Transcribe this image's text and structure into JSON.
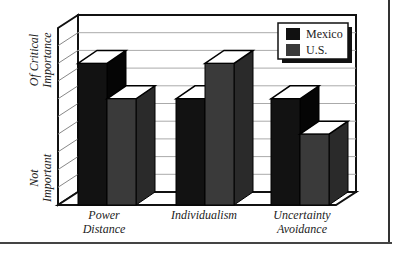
{
  "chart_data": {
    "type": "bar",
    "style": "3d-clustered",
    "title": "",
    "categories": [
      "Power Distance",
      "Individualism",
      "Uncertainty Avoidance"
    ],
    "category_lines": [
      [
        "Power",
        "Distance"
      ],
      [
        "Individualism"
      ],
      [
        "Uncertainty",
        "Avoidance"
      ]
    ],
    "series": [
      {
        "name": "Mexico",
        "values": [
          8,
          6,
          6
        ],
        "color": "#111111"
      },
      {
        "name": "U.S.",
        "values": [
          6,
          8,
          4
        ],
        "color": "#3a3a3a"
      }
    ],
    "ylabel_top": [
      "Of Critical",
      "Importance"
    ],
    "ylabel_bottom": [
      "Not",
      "Important"
    ],
    "ylim": [
      0,
      10
    ],
    "grid": true,
    "legend_position": "top-right"
  },
  "legend": {
    "items": [
      {
        "label": "Mexico"
      },
      {
        "label": "U.S."
      }
    ]
  },
  "axis": {
    "top_line1": "Of Critical",
    "top_line2": "Importance",
    "bottom_line1": "Not",
    "bottom_line2": "Important"
  },
  "xlabels": {
    "c0a": "Power",
    "c0b": "Distance",
    "c1a": "Individualism",
    "c2a": "Uncertainty",
    "c2b": "Avoidance"
  }
}
